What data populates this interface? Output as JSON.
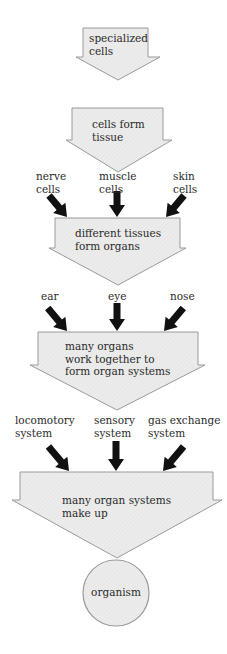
{
  "stages": [
    {
      "id": "stage-1",
      "text": "specialized\ncells"
    },
    {
      "id": "stage-2",
      "text": "cells form\ntissue"
    },
    {
      "id": "stage-3",
      "text": "different tissues\nform organs"
    },
    {
      "id": "stage-4",
      "text": "many organs\nwork together to\nform organ systems"
    },
    {
      "id": "stage-5",
      "text": "many organ systems\nmake up"
    }
  ],
  "inputs": {
    "tissues": [
      "nerve\ncells",
      "muscle\ncells",
      "skin\ncells"
    ],
    "organs": [
      "ear",
      "eye",
      "nose"
    ],
    "systems": [
      "locomotory\nsystem",
      "sensory\nsystem",
      "gas exchange\nsystem"
    ]
  },
  "result": {
    "text": "organism"
  },
  "colors": {
    "arrow_fill": "#ececec",
    "arrow_stroke": "#9a9a9a",
    "input_arrow": "#111111",
    "circle_fill": "#ececec"
  }
}
